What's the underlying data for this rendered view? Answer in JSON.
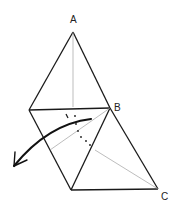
{
  "diagram": {
    "type": "origami-fold-step",
    "labels": {
      "a": "A",
      "b": "B",
      "c": "C"
    },
    "colors": {
      "edge": "#1a1a1a",
      "crease": "#9a9a9a",
      "dotted": "#1a1a1a",
      "arrow": "#111111",
      "background": "#ffffff"
    },
    "annotations": {
      "fold_arrow": "fold-direction-arrow",
      "dotted_line": "hidden-fold-line"
    }
  }
}
